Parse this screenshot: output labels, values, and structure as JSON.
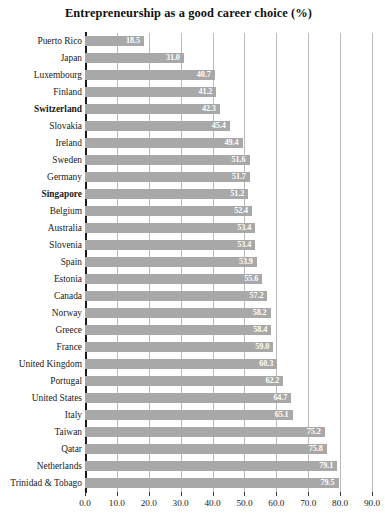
{
  "chart_data": {
    "type": "bar",
    "orientation": "horizontal",
    "title": "Entrepreneurship as a good career choice (%)",
    "xlabel": "",
    "ylabel": "",
    "xlim": [
      0.0,
      90.0
    ],
    "xticks": [
      "0.0",
      "10.0",
      "20.0",
      "30.0",
      "40.0",
      "50.0",
      "60.0",
      "70.0",
      "80.0",
      "90.0"
    ],
    "xtick_step": 10.0,
    "grid": true,
    "legend": false,
    "bar_color": "#a8a8a8",
    "value_label_color": "#ffffff",
    "categories": [
      "Puerto Rico",
      "Japan",
      "Luxembourg",
      "Finland",
      "Switzerland",
      "Slovakia",
      "Ireland",
      "Sweden",
      "Germany",
      "Singapore",
      "Belgium",
      "Australia",
      "Slovenia",
      "Spain",
      "Estonia",
      "Canada",
      "Norway",
      "Greece",
      "France",
      "United Kingdom",
      "Portugal",
      "United States",
      "Italy",
      "Taiwan",
      "Qatar",
      "Netherlands",
      "Trinidad & Tobago"
    ],
    "values": [
      18.5,
      31.0,
      40.7,
      41.2,
      42.3,
      45.4,
      49.4,
      51.6,
      51.7,
      51.2,
      52.4,
      53.4,
      53.4,
      53.9,
      55.6,
      57.2,
      58.2,
      58.4,
      59.0,
      60.3,
      62.2,
      64.7,
      65.1,
      75.2,
      75.8,
      79.1,
      79.5
    ],
    "value_labels": [
      "18.5",
      "31.0",
      "40.7",
      "41.2",
      "42.3",
      "45.4",
      "49.4",
      "51.6",
      "51.7",
      "51.2",
      "52.4",
      "53.4",
      "53.4",
      "53.9",
      "55.6",
      "57.2",
      "58.2",
      "58.4",
      "59.0",
      "60.3",
      "62.2",
      "64.7",
      "65.1",
      "75.2",
      "75.8",
      "79.1",
      "79.5"
    ],
    "emphasized_categories": [
      "Switzerland",
      "Singapore"
    ]
  }
}
